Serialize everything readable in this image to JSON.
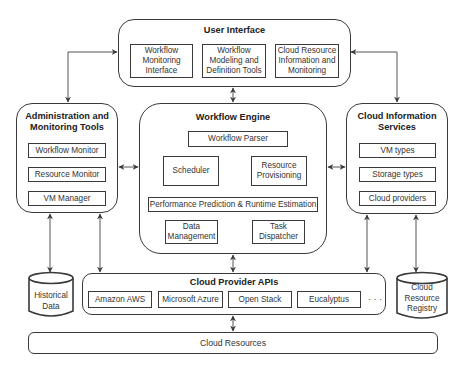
{
  "user_interface": {
    "title": "User Interface",
    "items": [
      "Workflow Monitoring Interface",
      "Workflow Modeling and Definition Tools",
      "Cloud Resource Information and Monitoring"
    ]
  },
  "admin_tools": {
    "title": "Administration and Monitoring Tools",
    "items": [
      "Workflow Monitor",
      "Resource Monitor",
      "VM Manager"
    ]
  },
  "workflow_engine": {
    "title": "Workflow Engine",
    "parser": "Workflow Parser",
    "scheduler": "Scheduler",
    "resource_provisioning": "Resource Provisioning",
    "performance": "Performance Prediction & Runtime Estimation",
    "data_management": "Data Management",
    "task_dispatcher": "Task Dispatcher"
  },
  "cloud_info": {
    "title": "Cloud Information Services",
    "items": [
      "VM types",
      "Storage types",
      "Cloud providers"
    ]
  },
  "cloud_provider_apis": {
    "title": "Cloud Provider APIs",
    "items": [
      "Amazon AWS",
      "Microsoft Azure",
      "Open Stack",
      "Eucalyptus"
    ],
    "ellipsis": "· · ·"
  },
  "historical_data": "Historical Data",
  "cloud_resource_registry": "Cloud Resource Registry",
  "cloud_resources": "Cloud Resources"
}
